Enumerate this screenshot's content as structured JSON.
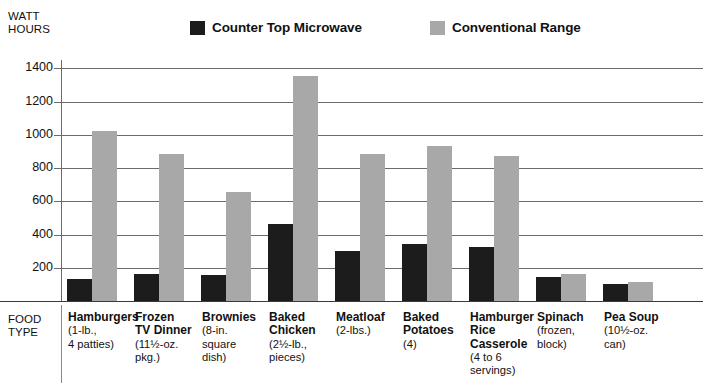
{
  "axis_title": {
    "line1": "WATT",
    "line2": "HOURS"
  },
  "food_type_header": {
    "line1": "FOOD",
    "line2": "TYPE"
  },
  "legend": [
    {
      "label": "Counter Top Microwave",
      "color": "#1c1c1c",
      "key": "microwave"
    },
    {
      "label": "Conventional Range",
      "color": "#a8a8a8",
      "key": "range"
    }
  ],
  "colors": {
    "microwave": "#1c1c1c",
    "range": "#a8a8a8",
    "gridline": "#6b6b6b",
    "axis": "#3a3a3a",
    "text": "#111111"
  },
  "chart_data": {
    "type": "bar",
    "title": "",
    "xlabel": "FOOD TYPE",
    "ylabel": "WATT HOURS",
    "ylim": [
      0,
      1450
    ],
    "yticks": [
      200,
      400,
      600,
      800,
      1000,
      1200,
      1400
    ],
    "grid": true,
    "legend_position": "top",
    "categories": [
      "Hamburgers",
      "Frozen TV Dinner",
      "Brownies",
      "Baked Chicken",
      "Meatloaf",
      "Baked Potatoes",
      "Hamburger Rice Casserole",
      "Spinach",
      "Pea Soup"
    ],
    "category_details": [
      [
        "(1-lb.,",
        "4 patties)"
      ],
      [
        "(11½-oz.",
        "pkg.)"
      ],
      [
        "(8-in.",
        "square",
        "dish)"
      ],
      [
        "(2½-lb.,",
        "pieces)"
      ],
      [
        "(2-lbs.)"
      ],
      [
        "(4)"
      ],
      [
        "(4 to 6",
        "servings)"
      ],
      [
        "(frozen,",
        "block)"
      ],
      [
        "(10½-oz.",
        "can)"
      ]
    ],
    "category_name_lines": [
      [
        "Hamburgers"
      ],
      [
        "Frozen",
        "TV Dinner"
      ],
      [
        "Brownies"
      ],
      [
        "Baked",
        "Chicken"
      ],
      [
        "Meatloaf"
      ],
      [
        "Baked",
        "Potatoes"
      ],
      [
        "Hamburger",
        "Rice",
        "Casserole"
      ],
      [
        "Spinach"
      ],
      [
        "Pea Soup"
      ]
    ],
    "series": [
      {
        "name": "Counter Top Microwave",
        "color": "#1c1c1c",
        "values": [
          130,
          165,
          155,
          465,
          300,
          345,
          325,
          145,
          100
        ]
      },
      {
        "name": "Conventional Range",
        "color": "#a8a8a8",
        "values": [
          1020,
          885,
          655,
          1355,
          885,
          935,
          875,
          165,
          115
        ]
      }
    ]
  }
}
